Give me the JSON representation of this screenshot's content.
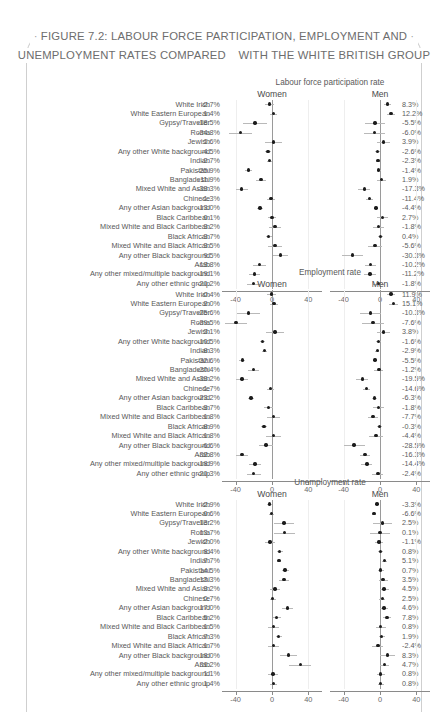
{
  "figure": {
    "title_lines": [
      "FIGURE 7.2: LABOUR FORCE PARTICIPATION, EMPLOYMENT AND",
      "UNEMPLOYMENT RATES COMPARED",
      "WITH THE WHITE BRITISH GROUP"
    ],
    "sub_women": "Women",
    "sub_men": "Men"
  },
  "chart_data": {
    "type": "scatter",
    "xlabel": "",
    "ylabel": "",
    "xlim": [
      -55,
      55
    ],
    "xticks": [
      -40,
      0,
      40
    ],
    "xticklabels": [
      "-40",
      "0",
      "40"
    ],
    "grid": true,
    "reference_line": 0,
    "legend": "none",
    "note": "Forest plot: point estimates (percentage-point difference vs White British) with confidence interval whiskers; three panels each split into Women and Men columns.",
    "categories": [
      "White Irish",
      "White Eastern European",
      "Gypsy/Traveller",
      "Roma",
      "Jewish",
      "Any other White background",
      "Indian",
      "Pakistani",
      "Bangladeshi",
      "Mixed White and Asian",
      "Chinese",
      "Any other Asian background",
      "Black Caribbean",
      "Mixed White and Black Caribbean",
      "Black African",
      "Mixed White and Black African",
      "Any other Black background",
      "Arab",
      "Any other mixed/multiple background",
      "Any other ethnic group"
    ],
    "panels": [
      {
        "title": "Labour force participation rate",
        "series": [
          {
            "name": "Women",
            "values": [
              -2.7,
              1.4,
              -18.5,
              -34.8,
              1.6,
              -4.5,
              -2.7,
              -25.9,
              -11.9,
              -33.3,
              -1.3,
              -13.0,
              0.1,
              3.2,
              -3.7,
              3.5,
              9.5,
              -13.8,
              -19.1,
              -20.2
            ],
            "labels": [
              "-2.7%",
              "1.4%",
              "-18.5%",
              "-34.8%",
              "1.6%",
              "-4.5%",
              "-2.7%",
              "-25.9%",
              "-11.9%",
              "-33.3%",
              "-1.3%",
              "-13.0%",
              "0.1%",
              "3.2%",
              "-3.7%",
              "3.5%",
              "9.5%",
              "-13.8%",
              "-19.1%",
              "-20.2%"
            ],
            "ci_low": [
              -7.5,
              -2.6,
              -32.0,
              -47.5,
              -8.0,
              -7.5,
              -5.5,
              -29.5,
              -17.5,
              -40.0,
              -5.5,
              -16.0,
              -4.5,
              -3.5,
              -7.0,
              -4.5,
              1.5,
              -20.5,
              -25.5,
              -27.5
            ],
            "ci_high": [
              2.1,
              5.4,
              -5.0,
              -22.1,
              11.2,
              -1.5,
              0.1,
              -22.3,
              -6.3,
              -26.6,
              2.9,
              -10.0,
              4.7,
              9.9,
              -0.4,
              11.5,
              17.5,
              -7.1,
              -12.7,
              -12.9
            ]
          },
          {
            "name": "Men",
            "values": [
              8.3,
              12.2,
              -5.5,
              -6.0,
              3.9,
              -2.6,
              -2.3,
              -1.4,
              1.9,
              -17.3,
              -11.4,
              -4.4,
              2.7,
              -1.8,
              0.4,
              -5.6,
              -30.3,
              -10.2,
              -11.2,
              -1.8
            ],
            "labels": [
              "8.3%",
              "12.2%",
              "-5.5%",
              "-6.0%",
              "3.9%",
              "-2.6%",
              "-2.3%",
              "-1.4%",
              "1.9%",
              "-17.3%",
              "-11.4%",
              "-4.4%",
              "2.7%",
              "-1.8%",
              "0.4%",
              "-5.6%",
              "-30.3%",
              "-10.2%",
              "-11.2%",
              "-1.8%"
            ],
            "ci_low": [
              4.0,
              7.5,
              -16.5,
              -18.0,
              -3.5,
              -5.0,
              -4.5,
              -3.8,
              -3.0,
              -24.0,
              -15.5,
              -7.0,
              -3.5,
              -7.5,
              -2.5,
              -13.0,
              -42.0,
              -16.0,
              -17.5,
              -8.0
            ],
            "ci_high": [
              12.6,
              16.9,
              5.5,
              6.0,
              11.3,
              -0.2,
              -0.1,
              1.0,
              6.8,
              -10.6,
              -7.3,
              -1.8,
              8.9,
              3.9,
              3.3,
              1.8,
              -18.6,
              -4.4,
              -4.9,
              4.4
            ]
          }
        ]
      },
      {
        "title": "Employment rate",
        "series": [
          {
            "name": "Women",
            "values": [
              -0.4,
              2.0,
              -25.6,
              -39.5,
              3.1,
              -10.5,
              -8.3,
              -32.6,
              -20.4,
              -33.2,
              -1.7,
              -23.2,
              -3.7,
              1.8,
              -8.9,
              1.8,
              -6.6,
              -32.8,
              -18.9,
              -20.3
            ],
            "labels": [
              "-0.4%",
              "2.0%",
              "-25.6%",
              "-39.5%",
              "3.1%",
              "-10.5%",
              "-8.3%",
              "-32.6%",
              "-20.4%",
              "-33.2%",
              "-1.7%",
              "-23.2%",
              "-3.7%",
              "1.8%",
              "-8.9%",
              "1.8%",
              "-6.6%",
              "-32.8%",
              "-18.9%",
              "-20.3%"
            ],
            "ci_low": [
              -5.2,
              -2.1,
              -38.5,
              -52.0,
              -6.5,
              -13.5,
              -11.0,
              -36.0,
              -26.0,
              -40.0,
              -6.0,
              -26.5,
              -8.5,
              -5.0,
              -12.5,
              -6.5,
              -14.0,
              -39.5,
              -25.5,
              -28.0
            ],
            "ci_high": [
              4.4,
              6.1,
              -12.7,
              -27.0,
              12.7,
              -7.5,
              -5.6,
              -29.2,
              -14.8,
              -26.4,
              2.6,
              -19.9,
              1.1,
              8.6,
              -5.3,
              10.1,
              0.8,
              -26.1,
              -12.3,
              -12.6
            ]
          },
          {
            "name": "Men",
            "values": [
              11.9,
              15.1,
              -10.3,
              -7.6,
              3.8,
              -1.6,
              -2.9,
              -5.5,
              -1.2,
              -19.5,
              -14.6,
              -6.3,
              -1.8,
              -7.7,
              -0.3,
              -4.4,
              -28.5,
              -16.3,
              -14.4,
              -2.4
            ],
            "labels": [
              "11.9%",
              "15.1%",
              "-10.3%",
              "-7.6%",
              "3.8%",
              "-1.6%",
              "-2.9%",
              "-5.5%",
              "-1.2%",
              "-19.5%",
              "-14.6%",
              "-6.3%",
              "-1.8%",
              "-7.7%",
              "-0.3%",
              "-4.4%",
              "-28.5%",
              "-16.3%",
              "-14.4%",
              "-2.4%"
            ],
            "ci_low": [
              7.6,
              10.4,
              -21.5,
              -19.5,
              -3.6,
              -4.0,
              -5.1,
              -7.9,
              -6.1,
              -26.0,
              -18.5,
              -8.9,
              -8.0,
              -13.5,
              -3.2,
              -12.0,
              -40.0,
              -22.0,
              -20.5,
              -8.6
            ],
            "ci_high": [
              16.2,
              19.8,
              0.9,
              4.3,
              11.2,
              0.8,
              -0.7,
              -3.1,
              3.7,
              -13.0,
              -10.7,
              -3.7,
              4.4,
              -1.9,
              2.6,
              3.2,
              -17.0,
              -10.6,
              -8.3,
              3.8
            ]
          }
        ]
      },
      {
        "title": "Unemployment rate",
        "series": [
          {
            "name": "Women",
            "values": [
              -2.9,
              -0.6,
              13.2,
              13.7,
              -2.0,
              8.4,
              7.7,
              14.5,
              13.3,
              3.2,
              0.7,
              17.0,
              5.2,
              1.5,
              7.3,
              1.7,
              18.0,
              31.2,
              1.1,
              1.4
            ],
            "labels": [
              "-2.9%",
              "-0.6%",
              "13.2%",
              "13.7%",
              "-2.0%",
              "8.4%",
              "7.7%",
              "14.5%",
              "13.3%",
              "3.2%",
              "0.7%",
              "17.0%",
              "5.2%",
              "1.5%",
              "7.3%",
              "1.7%",
              "18.0%",
              "31.2%",
              "1.1%",
              "1.4%"
            ],
            "ci_low": [
              -5.5,
              -3.2,
              2.0,
              2.5,
              -7.5,
              5.0,
              5.2,
              10.5,
              8.0,
              -2.0,
              -2.5,
              10.5,
              1.0,
              -4.5,
              4.0,
              -4.5,
              9.0,
              19.0,
              -4.0,
              -2.5
            ],
            "ci_high": [
              -0.3,
              2.0,
              24.4,
              24.9,
              3.5,
              11.8,
              10.2,
              18.5,
              18.6,
              8.4,
              3.9,
              23.5,
              9.4,
              7.5,
              10.6,
              7.9,
              27.0,
              43.4,
              6.2,
              5.3
            ]
          },
          {
            "name": "Men",
            "values": [
              -3.3,
              -6.6,
              2.5,
              0.1,
              -1.1,
              0.8,
              5.1,
              0.7,
              3.5,
              4.5,
              2.5,
              4.6,
              7.8,
              0.8,
              1.9,
              -2.4,
              8.3,
              4.7,
              0.8,
              0.8
            ],
            "labels": [
              "-3.3%",
              "-6.6%",
              "2.5%",
              "0.1%",
              "-1.1%",
              "0.8%",
              "5.1%",
              "0.7%",
              "3.5%",
              "4.5%",
              "2.5%",
              "4.6%",
              "7.8%",
              "0.8%",
              "1.9%",
              "-2.4%",
              "8.3%",
              "4.7%",
              "0.8%",
              "0.8%"
            ],
            "ci_low": [
              -5.9,
              -9.2,
              -8.0,
              -10.5,
              -6.0,
              -2.0,
              2.6,
              -2.5,
              -1.5,
              -0.5,
              -0.8,
              0.5,
              3.0,
              -4.5,
              -1.2,
              -8.5,
              0.5,
              0.0,
              -3.5,
              -2.5
            ],
            "ci_high": [
              -0.7,
              -4.0,
              13.0,
              10.7,
              3.8,
              3.6,
              7.6,
              3.9,
              8.5,
              9.5,
              5.8,
              8.7,
              12.6,
              6.1,
              5.0,
              3.7,
              16.1,
              9.4,
              5.1,
              4.1
            ]
          }
        ]
      }
    ]
  }
}
